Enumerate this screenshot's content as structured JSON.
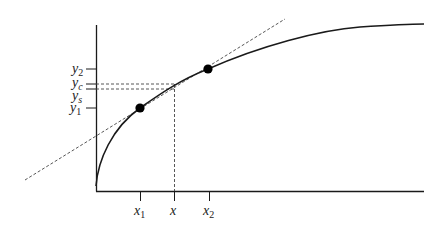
{
  "diagram": {
    "title": "",
    "colors": {
      "curve": "#1a1a1a",
      "dashed": "#444444",
      "point": "#000000",
      "axis": "#1a1a1a"
    },
    "y_labels": [
      {
        "id": "y2",
        "base": "y",
        "sub": "2"
      },
      {
        "id": "yc",
        "base": "y",
        "sub": "c"
      },
      {
        "id": "ys",
        "base": "y",
        "sub": "s"
      },
      {
        "id": "y1",
        "base": "y",
        "sub": "1"
      }
    ],
    "x_labels": [
      {
        "id": "x1",
        "base": "x",
        "sub": "1"
      },
      {
        "id": "x",
        "base": "x",
        "sub": ""
      },
      {
        "id": "x2",
        "base": "x",
        "sub": "2"
      }
    ],
    "points": [
      {
        "name": "P1",
        "label": "(x1, y1)"
      },
      {
        "name": "P2",
        "label": "(x2, y2)"
      }
    ]
  }
}
